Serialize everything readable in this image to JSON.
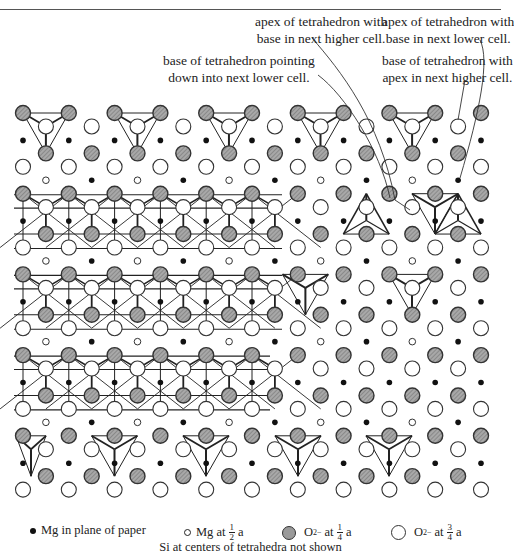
{
  "figure": {
    "callouts": [
      {
        "id": "c1",
        "lines": [
          "apex of tetrahedron with",
          "base in next higher cell."
        ]
      },
      {
        "id": "c2",
        "lines": [
          "base of tetrahedron pointing",
          "down into next lower cell."
        ]
      },
      {
        "id": "c3",
        "lines": [
          "apex of tetrahedron with",
          "base in next lower cell."
        ]
      },
      {
        "id": "c4",
        "lines": [
          "base of tetrahedron with",
          "apex in next higher cell."
        ]
      }
    ],
    "legend": {
      "mg_plane": {
        "label": "Mg in plane of paper",
        "symbol": "filled-black-dot"
      },
      "mg_half": {
        "label_pre": "Mg at",
        "frac_num": "1",
        "frac_den": "2",
        "label_post": "a",
        "symbol": "small-open-circle"
      },
      "o_quarter": {
        "label_pre": "O",
        "charge": "2−",
        "label_mid": "at",
        "frac_num": "1",
        "frac_den": "4",
        "label_post": "a",
        "symbol": "hatched-grey-circle"
      },
      "o_three_quarter": {
        "label_pre": "O",
        "charge": "2−",
        "label_mid": "at",
        "frac_num": "3",
        "frac_den": "4",
        "label_post": "a",
        "symbol": "large-open-circle"
      }
    },
    "footnote": "Si at centers of tetrahedra not shown",
    "colors": {
      "o_quarter_fill": "#9a9a9a",
      "o_three_quarter_fill": "#ffffff",
      "mg_plane_fill": "#111111",
      "outline": "#333333",
      "bond": "#222222"
    }
  }
}
